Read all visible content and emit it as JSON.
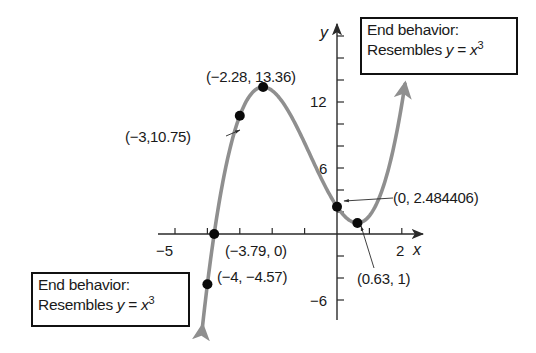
{
  "chart_data": {
    "type": "line",
    "function": "f(x) = x^3 + 2.48x^2 - 4.81x + 2.484406 (cubic, fitted to labeled points)",
    "coefficients": {
      "a3": 1,
      "a2": 2.4812,
      "a1": -4.3116,
      "a0": 2.484406
    },
    "x_range_drawn": [
      -4.15,
      2.1
    ],
    "xlabel": "x",
    "ylabel": "y",
    "xlim": [
      -5.2,
      2.6
    ],
    "ylim": [
      -7.5,
      19
    ],
    "x_ticks": [
      -5,
      -4,
      -3,
      -2,
      -1,
      0,
      1,
      2
    ],
    "x_tick_labels": [
      {
        "value": -5,
        "label": "−5"
      },
      {
        "value": 2,
        "label": "2"
      }
    ],
    "y_ticks": [
      -6,
      -4,
      -2,
      0,
      2,
      4,
      6,
      8,
      10,
      12,
      14,
      16,
      18
    ],
    "y_tick_labels": [
      {
        "value": 12,
        "label": "12"
      },
      {
        "value": 6,
        "label": "6"
      },
      {
        "value": -6,
        "label": "−6"
      }
    ],
    "grid": false,
    "points": [
      {
        "x": -4,
        "y": -4.57,
        "label": "(−4, −4.57)"
      },
      {
        "x": -3.79,
        "y": 0,
        "label": "(−3.79, 0)"
      },
      {
        "x": -3,
        "y": 10.75,
        "label": "(−3,10.75)"
      },
      {
        "x": -2.28,
        "y": 13.36,
        "label": "(−2.28, 13.36)"
      },
      {
        "x": 0,
        "y": 2.484406,
        "label": "(0, 2.484406)"
      },
      {
        "x": 0.63,
        "y": 1,
        "label": "(0.63, 1)"
      }
    ],
    "annotations": [
      {
        "text": "End behavior: Resembles y = x^3",
        "position": "top-right"
      },
      {
        "text": "End behavior: Resembles y = x^3",
        "position": "bottom-left"
      }
    ]
  },
  "labels": {
    "x_axis": "x",
    "y_axis": "y",
    "tick_neg5": "−5",
    "tick_2": "2",
    "tick_12": "12",
    "tick_6": "6",
    "tick_neg6": "−6",
    "pt_max": "(−2.28, 13.36)",
    "pt_neg3": "(−3,10.75)",
    "pt_yint": "(0, 2.484406)",
    "pt_xint": "(−3.79, 0)",
    "pt_neg4": "(−4, −4.57)",
    "pt_min": "(0.63, 1)"
  },
  "boxes": {
    "top_right": {
      "line1": "End behavior:",
      "line2_prefix": "Resembles ",
      "line2_var": "y",
      "line2_eq": " = ",
      "line2_x": "x",
      "line2_exp": "3"
    },
    "bottom_left": {
      "line1": "End behavior:",
      "line2_prefix": "Resembles ",
      "line2_var": "y",
      "line2_eq": " = ",
      "line2_x": "x",
      "line2_exp": "3"
    }
  },
  "colors": {
    "curve": "#8f8f8f",
    "axis": "#2a2a2a",
    "point": "#0a0a0a",
    "text": "#1a1a1a"
  }
}
